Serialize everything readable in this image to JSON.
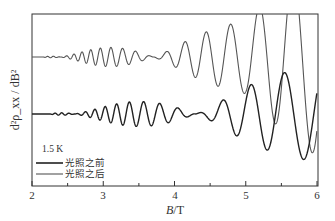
{
  "chart_data": {
    "type": "line",
    "title": "",
    "xlabel": "B/T",
    "ylabel": "d²ρxx/dB²",
    "xlim": [
      2,
      6
    ],
    "xticks": [
      2,
      3,
      4,
      5,
      6
    ],
    "xminor_ticks": [
      2.5,
      3.5,
      4.5,
      5.5
    ],
    "yticks": [],
    "grid": false,
    "legend_position": "lower-left",
    "annotation": "1.5 K",
    "series": [
      {
        "name": "光照之前",
        "color": "#222222",
        "offset_note": "lower curve (baseline ≈ middle of plot)",
        "description": "SdH-type oscillations starting ~2.3 T, amplitude grows to ~3.5 T, beat node near 4.2–4.5 T, then large amplitude oscillations up to 6 T",
        "x_peaks_approx": [
          4.85,
          5.25,
          5.55,
          5.82
        ],
        "onset_T": 2.3
      },
      {
        "name": "光照之后",
        "color": "#444444",
        "offset_note": "upper curve (offset above)",
        "description": "Oscillations starting ~2.2 T, grows to ~3.1 T, beat node near ~3.7 T, then rapidly growing amplitude, clipped at top above ~4.8 T",
        "x_peaks_approx": [
          4.3,
          4.5,
          4.65,
          4.8,
          4.95,
          5.1,
          5.3,
          5.5,
          5.7,
          5.88
        ],
        "onset_T": 2.2
      }
    ]
  },
  "axes": {
    "x_tick_labels": [
      "2",
      "3",
      "4",
      "5",
      "6"
    ],
    "x_label_italic": "B",
    "x_label_unit": "/T",
    "y_label": "d²ρ_xx / dB²"
  },
  "legend": {
    "temperature": "1.5 K",
    "items": [
      {
        "label": "光照之前",
        "weight": "bold"
      },
      {
        "label": "光照之后",
        "weight": "normal"
      }
    ]
  }
}
